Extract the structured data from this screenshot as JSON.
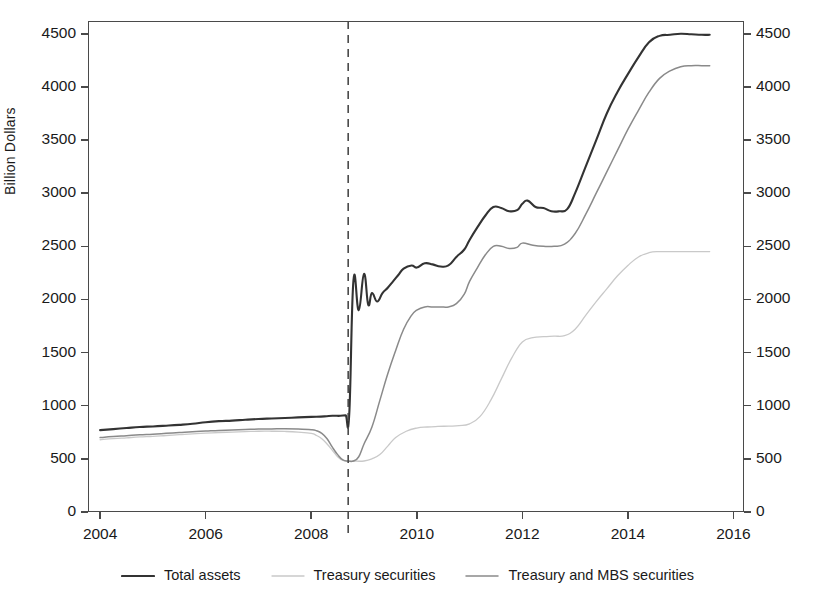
{
  "figure": {
    "ylabel": "Billion Dollars",
    "yticks": [
      0,
      500,
      1000,
      1500,
      2000,
      2500,
      3000,
      3500,
      4000,
      4500
    ],
    "ytick_labels": [
      "0",
      "500",
      "1000",
      "1500",
      "2000",
      "2500",
      "3000",
      "3500",
      "4000",
      "4500"
    ],
    "xticks": [
      2004,
      2006,
      2008,
      2010,
      2012,
      2014,
      2016
    ],
    "xtick_labels": [
      "2004",
      "2006",
      "2008",
      "2010",
      "2012",
      "2014",
      "2016"
    ],
    "right_axis_labels": [
      "0",
      "500",
      "1000",
      "1500",
      "2000",
      "2500",
      "3000",
      "3500",
      "4000",
      "4500"
    ],
    "annotation": {
      "name": "event-marker",
      "x": 2008.7,
      "style": "dashed-vertical",
      "color": "#4a4a4a"
    }
  },
  "legend": {
    "position": "below-axes",
    "items": [
      {
        "label": "Total assets",
        "color": "#333333",
        "width": 2.1
      },
      {
        "label": "Treasury securities",
        "color": "#c9c9c9",
        "width": 1.3
      },
      {
        "label": "Treasury and MBS securities",
        "color": "#8a8a8a",
        "width": 1.5
      }
    ]
  },
  "chart_data": {
    "type": "line",
    "title": "",
    "xlabel": "",
    "ylabel": "Billion Dollars",
    "xlim": [
      2003.77,
      2016.2
    ],
    "ylim": [
      0,
      4620
    ],
    "grid": false,
    "legend_position": "below",
    "annotations": [
      {
        "type": "vline",
        "x": 2008.7,
        "style": "dashed",
        "label": "September 2008"
      }
    ],
    "series": [
      {
        "name": "Total assets",
        "color": "#333333",
        "x": [
          2004.0,
          2004.25,
          2004.5,
          2004.75,
          2005.0,
          2005.25,
          2005.5,
          2005.75,
          2006.0,
          2006.25,
          2006.5,
          2006.75,
          2007.0,
          2007.25,
          2007.5,
          2007.75,
          2008.0,
          2008.25,
          2008.4,
          2008.55,
          2008.65,
          2008.72,
          2008.8,
          2008.9,
          2009.0,
          2009.08,
          2009.15,
          2009.25,
          2009.35,
          2009.45,
          2009.55,
          2009.65,
          2009.75,
          2009.9,
          2010.0,
          2010.15,
          2010.3,
          2010.45,
          2010.6,
          2010.75,
          2010.9,
          2011.0,
          2011.15,
          2011.3,
          2011.45,
          2011.6,
          2011.75,
          2011.9,
          2012.0,
          2012.1,
          2012.25,
          2012.4,
          2012.55,
          2012.7,
          2012.85,
          2013.0,
          2013.2,
          2013.4,
          2013.6,
          2013.8,
          2014.0,
          2014.2,
          2014.4,
          2014.6,
          2014.8,
          2015.0,
          2015.2,
          2015.4,
          2015.55
        ],
        "y": [
          770,
          780,
          790,
          800,
          805,
          812,
          820,
          830,
          845,
          855,
          860,
          868,
          875,
          880,
          885,
          890,
          895,
          900,
          905,
          905,
          910,
          920,
          2180,
          1900,
          2240,
          1950,
          2060,
          1980,
          2060,
          2110,
          2170,
          2230,
          2290,
          2320,
          2300,
          2340,
          2330,
          2310,
          2320,
          2400,
          2470,
          2560,
          2680,
          2790,
          2870,
          2860,
          2830,
          2840,
          2900,
          2930,
          2870,
          2860,
          2830,
          2830,
          2850,
          3000,
          3250,
          3500,
          3750,
          3950,
          4120,
          4280,
          4420,
          4480,
          4490,
          4500,
          4495,
          4490,
          4490
        ]
      },
      {
        "name": "Treasury and MBS securities",
        "color": "#8a8a8a",
        "x": [
          2004.0,
          2004.25,
          2004.5,
          2004.75,
          2005.0,
          2005.25,
          2005.5,
          2005.75,
          2006.0,
          2006.25,
          2006.5,
          2006.75,
          2007.0,
          2007.25,
          2007.5,
          2007.75,
          2008.0,
          2008.1,
          2008.2,
          2008.3,
          2008.4,
          2008.5,
          2008.6,
          2008.7,
          2008.8,
          2008.9,
          2009.0,
          2009.15,
          2009.3,
          2009.45,
          2009.6,
          2009.75,
          2009.9,
          2010.0,
          2010.15,
          2010.3,
          2010.45,
          2010.6,
          2010.75,
          2010.9,
          2011.0,
          2011.15,
          2011.3,
          2011.45,
          2011.6,
          2011.75,
          2011.9,
          2012.0,
          2012.2,
          2012.4,
          2012.6,
          2012.8,
          2013.0,
          2013.2,
          2013.4,
          2013.6,
          2013.8,
          2014.0,
          2014.2,
          2014.4,
          2014.6,
          2014.8,
          2015.0,
          2015.2,
          2015.4,
          2015.55
        ],
        "y": [
          700,
          710,
          718,
          726,
          732,
          740,
          748,
          756,
          762,
          768,
          772,
          776,
          780,
          782,
          784,
          782,
          775,
          765,
          740,
          690,
          610,
          540,
          490,
          480,
          480,
          520,
          640,
          800,
          1050,
          1300,
          1520,
          1720,
          1850,
          1900,
          1930,
          1930,
          1930,
          1930,
          1960,
          2050,
          2170,
          2300,
          2420,
          2500,
          2500,
          2480,
          2490,
          2530,
          2510,
          2500,
          2500,
          2520,
          2620,
          2800,
          3000,
          3200,
          3400,
          3600,
          3780,
          3950,
          4080,
          4150,
          4190,
          4200,
          4200,
          4200
        ]
      },
      {
        "name": "Treasury securities",
        "color": "#c9c9c9",
        "x": [
          2004.0,
          2004.25,
          2004.5,
          2004.75,
          2005.0,
          2005.25,
          2005.5,
          2005.75,
          2006.0,
          2006.25,
          2006.5,
          2006.75,
          2007.0,
          2007.25,
          2007.5,
          2007.75,
          2008.0,
          2008.1,
          2008.2,
          2008.3,
          2008.4,
          2008.5,
          2008.6,
          2008.7,
          2008.85,
          2009.0,
          2009.15,
          2009.3,
          2009.45,
          2009.6,
          2009.8,
          2010.0,
          2010.2,
          2010.4,
          2010.6,
          2010.8,
          2011.0,
          2011.2,
          2011.4,
          2011.6,
          2011.8,
          2012.0,
          2012.2,
          2012.4,
          2012.6,
          2012.8,
          2013.0,
          2013.2,
          2013.4,
          2013.6,
          2013.8,
          2014.0,
          2014.2,
          2014.4,
          2014.6,
          2014.8,
          2015.0,
          2015.2,
          2015.4,
          2015.55
        ],
        "y": [
          680,
          690,
          698,
          706,
          712,
          720,
          728,
          736,
          742,
          748,
          752,
          756,
          760,
          760,
          758,
          752,
          740,
          720,
          690,
          640,
          580,
          520,
          485,
          478,
          478,
          480,
          500,
          540,
          620,
          700,
          760,
          790,
          800,
          805,
          808,
          812,
          830,
          900,
          1050,
          1250,
          1450,
          1600,
          1640,
          1650,
          1655,
          1660,
          1720,
          1850,
          1980,
          2100,
          2220,
          2320,
          2400,
          2440,
          2450,
          2450,
          2450,
          2450,
          2450,
          2450
        ]
      }
    ]
  }
}
